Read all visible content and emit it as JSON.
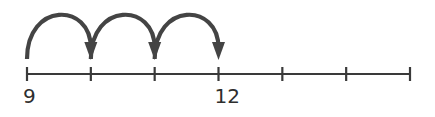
{
  "diagram": {
    "type": "number-line-jumps",
    "tick_count": 7,
    "start_value": 9,
    "step": 1,
    "labels": [
      {
        "tick_index": 0,
        "text": "9"
      },
      {
        "tick_index": 3,
        "text": "12"
      }
    ],
    "jumps": [
      {
        "from_tick": 0,
        "to_tick": 1
      },
      {
        "from_tick": 1,
        "to_tick": 2
      },
      {
        "from_tick": 2,
        "to_tick": 3
      }
    ],
    "colors": {
      "line": "#3a3a3a",
      "arc": "#444444",
      "label": "#2e2e2e"
    }
  }
}
